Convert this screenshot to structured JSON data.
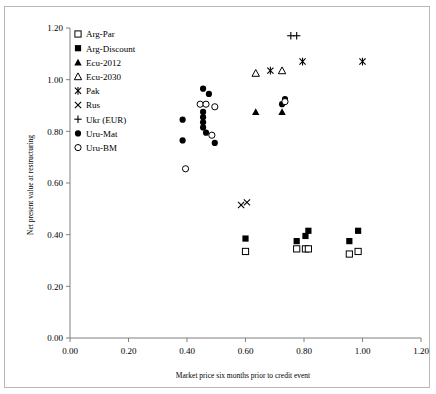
{
  "chart_data": {
    "type": "scatter",
    "title": "",
    "xlabel": "Market price six months prior to credit event",
    "ylabel": "Net present value at restructuring",
    "xlim": [
      0.0,
      1.2
    ],
    "ylim": [
      0.0,
      1.2
    ],
    "xticks": [
      "0.00",
      "0.20",
      "0.40",
      "0.60",
      "0.80",
      "1.00",
      "1.20"
    ],
    "yticks": [
      "0.00",
      "0.20",
      "0.40",
      "0.60",
      "0.80",
      "1.00",
      "1.20"
    ],
    "xtick_values": [
      0.0,
      0.2,
      0.4,
      0.6,
      0.8,
      1.0,
      1.2
    ],
    "ytick_values": [
      0.0,
      0.2,
      0.4,
      0.6,
      0.8,
      1.0,
      1.2
    ],
    "grid": false,
    "legend_position": "top-left inside",
    "series": [
      {
        "name": "Arg-Par",
        "marker": "open-square",
        "points": [
          {
            "x": 0.6,
            "y": 0.335
          },
          {
            "x": 0.775,
            "y": 0.345
          },
          {
            "x": 0.805,
            "y": 0.345
          },
          {
            "x": 0.815,
            "y": 0.345
          },
          {
            "x": 0.955,
            "y": 0.325
          },
          {
            "x": 0.985,
            "y": 0.335
          }
        ]
      },
      {
        "name": "Arg-Discount",
        "marker": "filled-square",
        "points": [
          {
            "x": 0.6,
            "y": 0.385
          },
          {
            "x": 0.775,
            "y": 0.375
          },
          {
            "x": 0.805,
            "y": 0.395
          },
          {
            "x": 0.815,
            "y": 0.415
          },
          {
            "x": 0.955,
            "y": 0.375
          },
          {
            "x": 0.985,
            "y": 0.415
          }
        ]
      },
      {
        "name": "Ecu-2012",
        "marker": "filled-triangle",
        "points": [
          {
            "x": 0.635,
            "y": 0.875
          },
          {
            "x": 0.725,
            "y": 0.875
          }
        ]
      },
      {
        "name": "Ecu-2030",
        "marker": "open-triangle",
        "points": [
          {
            "x": 0.635,
            "y": 1.025
          },
          {
            "x": 0.725,
            "y": 1.035
          }
        ]
      },
      {
        "name": "Pak",
        "marker": "asterisk",
        "points": [
          {
            "x": 0.685,
            "y": 1.035
          },
          {
            "x": 0.795,
            "y": 1.07
          },
          {
            "x": 1.0,
            "y": 1.07
          }
        ]
      },
      {
        "name": "Rus",
        "marker": "cross-x",
        "points": [
          {
            "x": 0.585,
            "y": 0.515
          },
          {
            "x": 0.605,
            "y": 0.525
          }
        ]
      },
      {
        "name": "Ukr (EUR)",
        "marker": "plus",
        "points": [
          {
            "x": 0.755,
            "y": 1.17
          },
          {
            "x": 0.775,
            "y": 1.17
          }
        ]
      },
      {
        "name": "Uru-Mat",
        "marker": "filled-circle",
        "points": [
          {
            "x": 0.385,
            "y": 0.845
          },
          {
            "x": 0.385,
            "y": 0.765
          },
          {
            "x": 0.455,
            "y": 0.965
          },
          {
            "x": 0.475,
            "y": 0.945
          },
          {
            "x": 0.455,
            "y": 0.875
          },
          {
            "x": 0.455,
            "y": 0.855
          },
          {
            "x": 0.455,
            "y": 0.835
          },
          {
            "x": 0.455,
            "y": 0.815
          },
          {
            "x": 0.465,
            "y": 0.795
          },
          {
            "x": 0.495,
            "y": 0.755
          },
          {
            "x": 0.725,
            "y": 0.905
          },
          {
            "x": 0.735,
            "y": 0.925
          }
        ]
      },
      {
        "name": "Uru-BM",
        "marker": "open-circle",
        "points": [
          {
            "x": 0.395,
            "y": 0.655
          },
          {
            "x": 0.445,
            "y": 0.905
          },
          {
            "x": 0.465,
            "y": 0.905
          },
          {
            "x": 0.495,
            "y": 0.895
          },
          {
            "x": 0.485,
            "y": 0.785
          },
          {
            "x": 0.735,
            "y": 0.915
          }
        ]
      }
    ]
  },
  "legend": {
    "items": [
      {
        "label": "Arg-Par",
        "marker": "open-square"
      },
      {
        "label": "Arg-Discount",
        "marker": "filled-square"
      },
      {
        "label": "Ecu-2012",
        "marker": "filled-triangle"
      },
      {
        "label": "Ecu-2030",
        "marker": "open-triangle"
      },
      {
        "label": "Pak",
        "marker": "asterisk"
      },
      {
        "label": "Rus",
        "marker": "cross-x"
      },
      {
        "label": "Ukr (EUR)",
        "marker": "plus"
      },
      {
        "label": "Uru-Mat",
        "marker": "filled-circle"
      },
      {
        "label": "Uru-BM",
        "marker": "open-circle"
      }
    ]
  }
}
